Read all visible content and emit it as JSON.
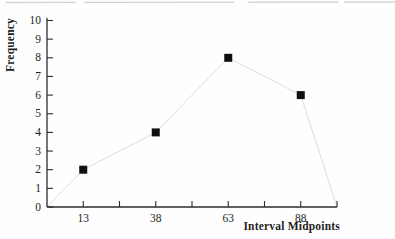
{
  "chart_data": {
    "type": "scatter",
    "title": "",
    "xlabel": "Interval Midpoints",
    "ylabel": "Frequency",
    "x": [
      13,
      38,
      63,
      88
    ],
    "y": [
      2,
      4,
      8,
      6
    ],
    "xlim": [
      0.5,
      100.5
    ],
    "ylim": [
      0,
      10
    ],
    "x_ticks": [
      13,
      25.5,
      38,
      50.5,
      63,
      75.5,
      88,
      100.5
    ],
    "x_tick_labels": [
      "13",
      "",
      "38",
      "",
      "63",
      "",
      "88",
      ""
    ],
    "y_ticks": [
      0,
      1,
      2,
      3,
      4,
      5,
      6,
      7,
      8,
      9,
      10
    ],
    "y_tick_labels": [
      "0",
      "1",
      "2",
      "3",
      "4",
      "5",
      "6",
      "7",
      "8",
      "9",
      "10"
    ],
    "grid": false,
    "legend": "none",
    "marker": {
      "shape": "filled-square",
      "color": "#101010",
      "size_px": 8
    },
    "connector": {
      "visible": true,
      "style": "faint",
      "color": "#d9d9d9",
      "closes_to_zero_at_x": [
        0.5,
        100.5
      ]
    },
    "axis_color": "#2d2d2d",
    "text_color": "#1f1f1f"
  }
}
